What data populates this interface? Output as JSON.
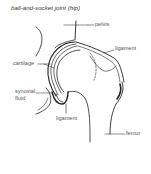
{
  "title": "ball-and-socket joint (hip)",
  "labels": {
    "pelvis": "pelvis",
    "ligament_top": "ligament",
    "cartilage": "cartilage",
    "synovial_fluid_1": "synovial",
    "synovial_fluid_2": "fluid",
    "ligament_bottom": "ligament",
    "femur": "femur"
  },
  "colors": {
    "line": "#222222",
    "label": "#555555",
    "background": "#ffffff"
  }
}
